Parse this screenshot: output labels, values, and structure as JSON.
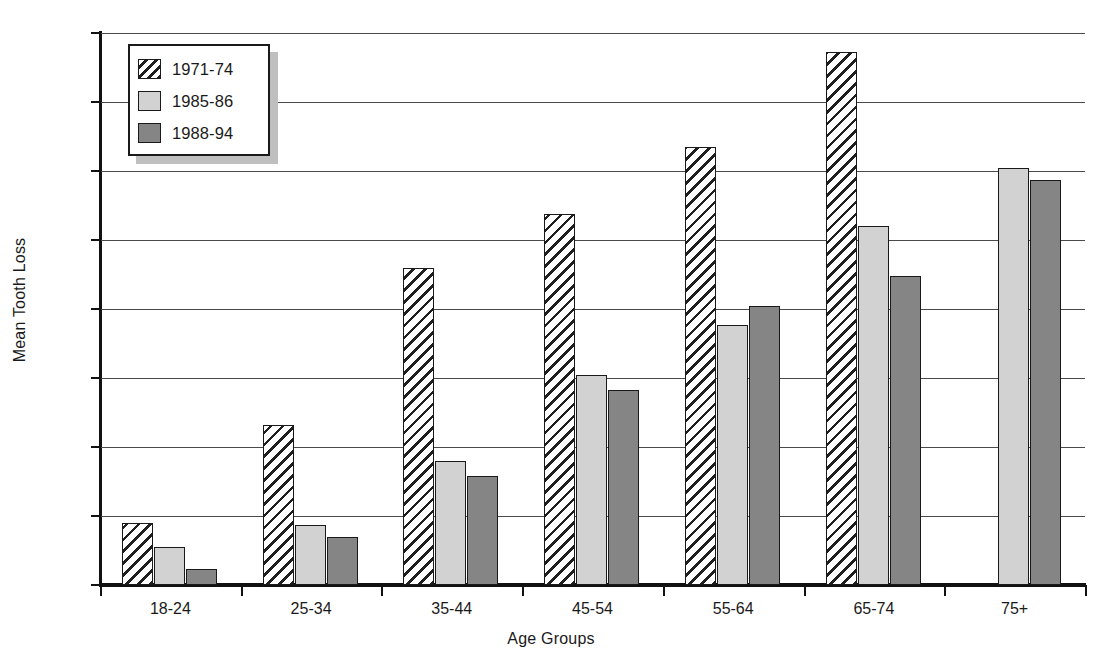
{
  "chart_data": {
    "type": "bar",
    "title": "",
    "xlabel": "Age Groups",
    "ylabel": "Mean Tooth Loss",
    "categories": [
      "18-24",
      "25-34",
      "35-44",
      "45-54",
      "55-64",
      "65-74",
      "75+"
    ],
    "series": [
      {
        "name": "1971-74",
        "values": [
          1.8,
          4.65,
          9.2,
          10.75,
          12.7,
          15.45,
          null
        ],
        "swatch": "hatched",
        "color": "#ffffff"
      },
      {
        "name": "1985-86",
        "values": [
          1.1,
          1.75,
          3.6,
          6.1,
          7.55,
          10.4,
          12.1
        ],
        "swatch": "solid",
        "color": "#d2d2d2"
      },
      {
        "name": "1988-94",
        "values": [
          0.45,
          1.4,
          3.15,
          5.65,
          8.1,
          8.95,
          11.75
        ],
        "swatch": "solid",
        "color": "#858585"
      }
    ],
    "ylim": [
      0,
      16
    ],
    "ytick_values": [
      0,
      2,
      4,
      6,
      8,
      10,
      12,
      14,
      16
    ],
    "ytick_labels": [
      "0",
      "2",
      "4",
      "6",
      "8",
      "10",
      "12",
      "14",
      "16"
    ],
    "grid": true,
    "legend_position": "upper-left-inside",
    "axis_color": "#1a1a1a",
    "grid_color": "#4a4a4a",
    "background": "#ffffff"
  }
}
